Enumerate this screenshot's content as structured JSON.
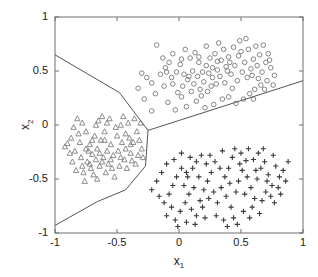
{
  "chart_data": {
    "type": "scatter",
    "title": "",
    "xlabel": "x_1",
    "ylabel": "x_2",
    "xlabel_base": "x",
    "xlabel_sub": "1",
    "ylabel_base": "x",
    "ylabel_sub": "2",
    "xlim": [
      -1,
      1
    ],
    "ylim": [
      -1,
      1
    ],
    "grid": false,
    "legend": "none",
    "xticks": [
      -1,
      -0.5,
      0,
      0.5,
      1
    ],
    "xtick_labels": [
      "-1",
      "-0.5",
      "0",
      "0.5",
      "1"
    ],
    "yticks": [
      -1,
      -0.5,
      0,
      0.5,
      1
    ],
    "ytick_labels": [
      "-1",
      "-0.5",
      "0",
      "0.5",
      "1"
    ],
    "marker_colors": {
      "circle": "#777777",
      "triangle": "#808080",
      "plus": "#3a3a3a",
      "boundary": "#555555",
      "axes": "#6e6e6e"
    },
    "series": [
      {
        "name": "class-circle",
        "marker": "circle",
        "color": "#777777",
        "points": [
          [
            -0.18,
            0.74
          ],
          [
            -0.11,
            0.53
          ],
          [
            -0.15,
            0.47
          ],
          [
            -0.22,
            0.39
          ],
          [
            -0.26,
            0.44
          ],
          [
            -0.3,
            0.48
          ],
          [
            -0.33,
            0.34
          ],
          [
            -0.28,
            0.24
          ],
          [
            -0.22,
            0.13
          ],
          [
            -0.09,
            0.21
          ],
          [
            -0.05,
            0.38
          ],
          [
            -0.02,
            0.49
          ],
          [
            -0.08,
            0.58
          ],
          [
            -0.13,
            0.62
          ],
          [
            -0.05,
            0.66
          ],
          [
            0.01,
            0.56
          ],
          [
            0.04,
            0.47
          ],
          [
            0.07,
            0.42
          ],
          [
            0.03,
            0.36
          ],
          [
            -0.01,
            0.3
          ],
          [
            0.09,
            0.62
          ],
          [
            0.13,
            0.67
          ],
          [
            0.16,
            0.58
          ],
          [
            0.11,
            0.5
          ],
          [
            0.15,
            0.45
          ],
          [
            0.19,
            0.49
          ],
          [
            0.22,
            0.55
          ],
          [
            0.25,
            0.62
          ],
          [
            0.2,
            0.4
          ],
          [
            0.17,
            0.33
          ],
          [
            0.23,
            0.31
          ],
          [
            0.27,
            0.44
          ],
          [
            0.31,
            0.51
          ],
          [
            0.34,
            0.6
          ],
          [
            0.29,
            0.66
          ],
          [
            0.36,
            0.7
          ],
          [
            0.4,
            0.63
          ],
          [
            0.38,
            0.54
          ],
          [
            0.33,
            0.45
          ],
          [
            0.3,
            0.38
          ],
          [
            0.42,
            0.47
          ],
          [
            0.45,
            0.55
          ],
          [
            0.48,
            0.64
          ],
          [
            0.44,
            0.72
          ],
          [
            0.5,
            0.68
          ],
          [
            0.53,
            0.58
          ],
          [
            0.51,
            0.49
          ],
          [
            0.47,
            0.41
          ],
          [
            0.55,
            0.44
          ],
          [
            0.58,
            0.52
          ],
          [
            0.6,
            0.61
          ],
          [
            0.56,
            0.7
          ],
          [
            0.62,
            0.73
          ],
          [
            0.65,
            0.65
          ],
          [
            0.63,
            0.55
          ],
          [
            0.59,
            0.46
          ],
          [
            0.67,
            0.49
          ],
          [
            0.7,
            0.58
          ],
          [
            0.72,
            0.66
          ],
          [
            0.68,
            0.74
          ],
          [
            0.74,
            0.53
          ],
          [
            0.77,
            0.46
          ],
          [
            0.71,
            0.41
          ],
          [
            0.66,
            0.37
          ],
          [
            0.61,
            0.33
          ],
          [
            0.57,
            0.29
          ],
          [
            0.52,
            0.24
          ],
          [
            0.46,
            0.2
          ],
          [
            0.4,
            0.26
          ],
          [
            0.35,
            0.24
          ],
          [
            0.28,
            0.19
          ],
          [
            0.21,
            0.16
          ],
          [
            0.14,
            0.22
          ],
          [
            0.06,
            0.17
          ],
          [
            -0.03,
            0.14
          ],
          [
            0.43,
            0.34
          ],
          [
            0.37,
            0.39
          ],
          [
            0.26,
            0.36
          ],
          [
            0.18,
            0.27
          ],
          [
            0.1,
            0.31
          ],
          [
            0.02,
            0.26
          ],
          [
            -0.06,
            0.44
          ],
          [
            -0.12,
            0.36
          ],
          [
            -0.19,
            0.29
          ],
          [
            0.05,
            0.7
          ],
          [
            0.22,
            0.73
          ],
          [
            0.32,
            0.76
          ],
          [
            0.49,
            0.78
          ],
          [
            0.54,
            0.8
          ],
          [
            0.08,
            0.45
          ],
          [
            0.12,
            0.38
          ],
          [
            0.24,
            0.48
          ],
          [
            0.39,
            0.5
          ],
          [
            0.41,
            0.58
          ],
          [
            0.64,
            0.43
          ],
          [
            0.69,
            0.33
          ],
          [
            0.73,
            0.6
          ],
          [
            0.76,
            0.37
          ],
          [
            0.6,
            0.24
          ],
          [
            0.31,
            0.59
          ],
          [
            0.27,
            0.53
          ],
          [
            0.16,
            0.63
          ],
          [
            0.02,
            0.61
          ],
          [
            -0.1,
            0.49
          ]
        ]
      },
      {
        "name": "class-triangle",
        "marker": "triangle",
        "color": "#808080",
        "points": [
          [
            -0.92,
            -0.2
          ],
          [
            -0.87,
            -0.12
          ],
          [
            -0.82,
            0.06
          ],
          [
            -0.78,
            0.02
          ],
          [
            -0.75,
            -0.06
          ],
          [
            -0.8,
            -0.16
          ],
          [
            -0.84,
            -0.24
          ],
          [
            -0.79,
            -0.3
          ],
          [
            -0.74,
            -0.34
          ],
          [
            -0.7,
            -0.27
          ],
          [
            -0.72,
            -0.18
          ],
          [
            -0.68,
            -0.1
          ],
          [
            -0.65,
            0.04
          ],
          [
            -0.62,
            0.08
          ],
          [
            -0.58,
            0.02
          ],
          [
            -0.6,
            -0.06
          ],
          [
            -0.63,
            -0.14
          ],
          [
            -0.66,
            -0.22
          ],
          [
            -0.61,
            -0.3
          ],
          [
            -0.57,
            -0.36
          ],
          [
            -0.53,
            -0.28
          ],
          [
            -0.55,
            -0.18
          ],
          [
            -0.5,
            -0.1
          ],
          [
            -0.47,
            0.0
          ],
          [
            -0.45,
            0.08
          ],
          [
            -0.41,
            0.02
          ],
          [
            -0.43,
            -0.08
          ],
          [
            -0.46,
            -0.16
          ],
          [
            -0.49,
            -0.24
          ],
          [
            -0.44,
            -0.32
          ],
          [
            -0.39,
            -0.26
          ],
          [
            -0.37,
            -0.16
          ],
          [
            -0.34,
            -0.06
          ],
          [
            -0.31,
            0.02
          ],
          [
            -0.36,
            0.06
          ],
          [
            -0.4,
            -0.12
          ],
          [
            -0.86,
            -0.34
          ],
          [
            -0.83,
            -0.42
          ],
          [
            -0.77,
            -0.44
          ],
          [
            -0.71,
            -0.4
          ],
          [
            -0.76,
            -0.52
          ],
          [
            -0.69,
            -0.46
          ],
          [
            -0.64,
            -0.38
          ],
          [
            -0.67,
            -0.32
          ],
          [
            -0.59,
            -0.44
          ],
          [
            -0.54,
            -0.4
          ],
          [
            -0.52,
            -0.48
          ],
          [
            -0.48,
            -0.38
          ],
          [
            -0.42,
            -0.4
          ],
          [
            -0.38,
            -0.33
          ],
          [
            -0.33,
            -0.28
          ],
          [
            -0.3,
            -0.22
          ],
          [
            -0.35,
            -0.36
          ],
          [
            -0.73,
            -0.24
          ],
          [
            -0.81,
            -0.08
          ],
          [
            -0.88,
            -0.26
          ],
          [
            -0.9,
            -0.17
          ],
          [
            -0.85,
            -0.02
          ],
          [
            -0.67,
            0.0
          ],
          [
            -0.56,
            0.06
          ],
          [
            -0.51,
            -0.02
          ],
          [
            -0.58,
            -0.24
          ],
          [
            -0.62,
            -0.34
          ],
          [
            -0.72,
            -0.36
          ],
          [
            -0.78,
            -0.38
          ],
          [
            -0.66,
            -0.5
          ],
          [
            -0.75,
            -0.22
          ],
          [
            -0.7,
            -0.14
          ],
          [
            -0.64,
            -0.26
          ],
          [
            -0.6,
            -0.14
          ],
          [
            -0.55,
            -0.32
          ],
          [
            -0.47,
            -0.3
          ],
          [
            -0.43,
            -0.22
          ],
          [
            -0.39,
            -0.18
          ],
          [
            -0.32,
            -0.14
          ],
          [
            -0.29,
            -0.3
          ]
        ]
      },
      {
        "name": "class-plus",
        "marker": "plus",
        "color": "#3a3a3a",
        "points": [
          [
            -0.22,
            -0.6
          ],
          [
            -0.18,
            -0.52
          ],
          [
            -0.14,
            -0.44
          ],
          [
            -0.1,
            -0.36
          ],
          [
            -0.16,
            -0.66
          ],
          [
            -0.12,
            -0.72
          ],
          [
            -0.08,
            -0.64
          ],
          [
            -0.05,
            -0.56
          ],
          [
            -0.02,
            -0.48
          ],
          [
            0.02,
            -0.4
          ],
          [
            -0.06,
            -0.76
          ],
          [
            -0.1,
            -0.84
          ],
          [
            -0.03,
            -0.88
          ],
          [
            0.01,
            -0.8
          ],
          [
            0.05,
            -0.72
          ],
          [
            0.08,
            -0.64
          ],
          [
            0.04,
            -0.56
          ],
          [
            0.07,
            -0.48
          ],
          [
            0.11,
            -0.4
          ],
          [
            0.14,
            -0.34
          ],
          [
            0.1,
            -0.78
          ],
          [
            0.14,
            -0.84
          ],
          [
            0.17,
            -0.7
          ],
          [
            0.2,
            -0.6
          ],
          [
            0.23,
            -0.52
          ],
          [
            0.26,
            -0.44
          ],
          [
            0.22,
            -0.36
          ],
          [
            0.18,
            -0.28
          ],
          [
            0.28,
            -0.62
          ],
          [
            0.31,
            -0.72
          ],
          [
            0.34,
            -0.58
          ],
          [
            0.37,
            -0.48
          ],
          [
            0.4,
            -0.4
          ],
          [
            0.43,
            -0.3
          ],
          [
            0.38,
            -0.66
          ],
          [
            0.42,
            -0.76
          ],
          [
            0.46,
            -0.62
          ],
          [
            0.48,
            -0.52
          ],
          [
            0.51,
            -0.42
          ],
          [
            0.54,
            -0.33
          ],
          [
            0.5,
            -0.26
          ],
          [
            0.45,
            -0.22
          ],
          [
            0.55,
            -0.48
          ],
          [
            0.58,
            -0.58
          ],
          [
            0.61,
            -0.68
          ],
          [
            0.63,
            -0.5
          ],
          [
            0.66,
            -0.4
          ],
          [
            0.6,
            -0.32
          ],
          [
            0.64,
            -0.26
          ],
          [
            0.69,
            -0.34
          ],
          [
            0.72,
            -0.46
          ],
          [
            0.75,
            -0.56
          ],
          [
            0.7,
            -0.62
          ],
          [
            0.78,
            -0.38
          ],
          [
            0.81,
            -0.48
          ],
          [
            0.84,
            -0.42
          ],
          [
            0.76,
            -0.28
          ],
          [
            0.68,
            -0.22
          ],
          [
            0.56,
            -0.22
          ],
          [
            0.49,
            -0.36
          ],
          [
            0.41,
            -0.54
          ],
          [
            0.33,
            -0.4
          ],
          [
            0.29,
            -0.34
          ],
          [
            0.25,
            -0.28
          ],
          [
            0.3,
            -0.84
          ],
          [
            0.36,
            -0.88
          ],
          [
            0.44,
            -0.86
          ],
          [
            0.52,
            -0.8
          ],
          [
            0.59,
            -0.76
          ],
          [
            0.67,
            -0.7
          ],
          [
            0.74,
            -0.66
          ],
          [
            0.8,
            -0.58
          ],
          [
            0.86,
            -0.52
          ],
          [
            0.88,
            -0.34
          ],
          [
            0.82,
            -0.64
          ],
          [
            0.65,
            -0.82
          ],
          [
            0.57,
            -0.86
          ],
          [
            0.47,
            -0.92
          ],
          [
            0.39,
            -0.94
          ],
          [
            0.21,
            -0.86
          ],
          [
            0.13,
            -0.92
          ],
          [
            0.06,
            -0.9
          ],
          [
            -0.01,
            -0.94
          ],
          [
            0.16,
            -0.48
          ],
          [
            0.09,
            -0.3
          ],
          [
            0.02,
            -0.26
          ],
          [
            -0.04,
            -0.32
          ],
          [
            0.53,
            -0.64
          ],
          [
            0.62,
            -0.42
          ],
          [
            0.71,
            -0.52
          ],
          [
            0.35,
            -0.24
          ],
          [
            0.77,
            -0.72
          ],
          [
            0.24,
            -0.68
          ],
          [
            0.19,
            -0.76
          ],
          [
            0.12,
            -0.58
          ],
          [
            0.06,
            -0.44
          ]
        ]
      }
    ],
    "decision_boundary": {
      "description": "piecewise-linear three-region decision boundary",
      "segments": [
        {
          "name": "upper-left-branch",
          "points": [
            [
              -1.0,
              0.65
            ],
            [
              -0.48,
              0.3
            ],
            [
              -0.25,
              -0.05
            ]
          ]
        },
        {
          "name": "upper-right-branch",
          "points": [
            [
              -0.25,
              -0.05
            ],
            [
              1.0,
              0.41
            ]
          ]
        },
        {
          "name": "lower-branch",
          "points": [
            [
              -0.25,
              -0.05
            ],
            [
              -0.27,
              -0.38
            ],
            [
              -0.43,
              -0.6
            ],
            [
              -0.66,
              -0.71
            ],
            [
              -1.0,
              -0.93
            ]
          ]
        }
      ]
    }
  }
}
